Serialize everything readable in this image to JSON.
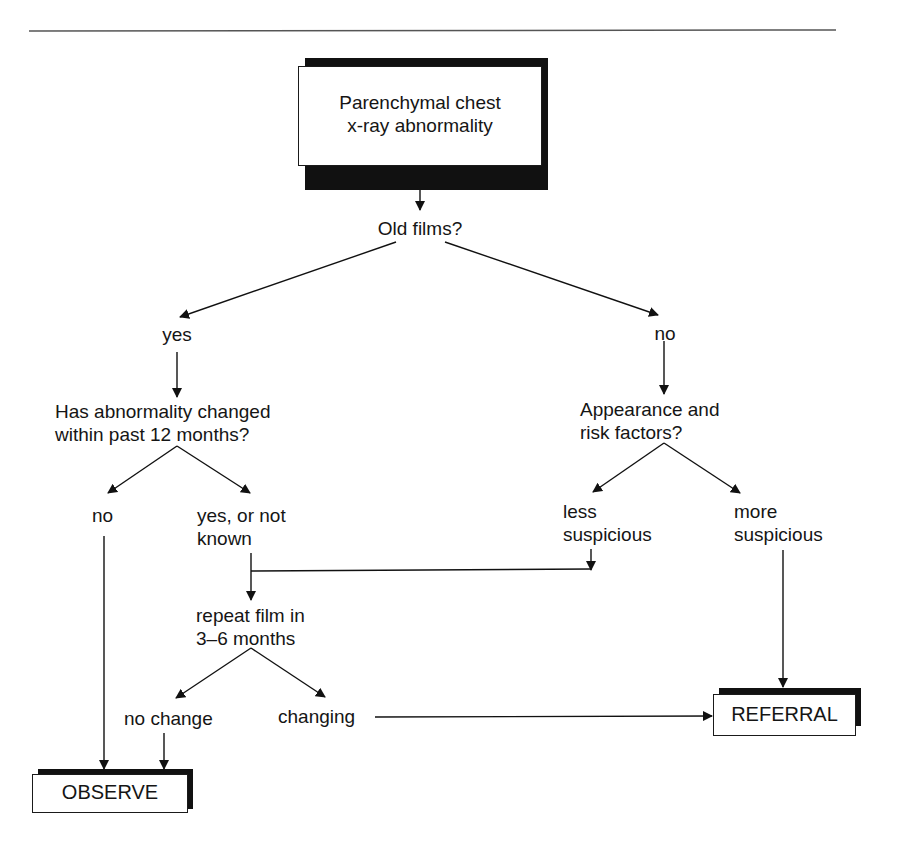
{
  "diagram": {
    "type": "flowchart",
    "nodes": {
      "start": {
        "line1": "Parenchymal chest",
        "line2": "x-ray abnormality"
      },
      "q_old_films": "Old films?",
      "old_yes": "yes",
      "old_no": "no",
      "q_changed": {
        "line1": "Has abnormality changed",
        "line2": "within past 12 months?"
      },
      "changed_no": "no",
      "changed_yes": {
        "line1": "yes, or not",
        "line2": "known"
      },
      "q_appearance": {
        "line1": "Appearance and",
        "line2": "risk factors?"
      },
      "less_suspicious": {
        "line1": "less",
        "line2": "suspicious"
      },
      "more_suspicious": {
        "line1": "more",
        "line2": "suspicious"
      },
      "repeat_film": {
        "line1": "repeat film in",
        "line2": "3–6 months"
      },
      "no_change": "no change",
      "changing": "changing",
      "observe": "OBSERVE",
      "referral": "REFERRAL"
    },
    "edges": [
      [
        "start",
        "q_old_films"
      ],
      [
        "q_old_films",
        "old_yes"
      ],
      [
        "q_old_films",
        "old_no"
      ],
      [
        "old_yes",
        "q_changed"
      ],
      [
        "old_no",
        "q_appearance"
      ],
      [
        "q_changed",
        "changed_no"
      ],
      [
        "q_changed",
        "changed_yes"
      ],
      [
        "q_appearance",
        "less_suspicious"
      ],
      [
        "q_appearance",
        "more_suspicious"
      ],
      [
        "changed_yes",
        "repeat_film"
      ],
      [
        "less_suspicious",
        "repeat_film"
      ],
      [
        "changed_no",
        "observe"
      ],
      [
        "more_suspicious",
        "referral"
      ],
      [
        "repeat_film",
        "no_change"
      ],
      [
        "repeat_film",
        "changing"
      ],
      [
        "no_change",
        "observe"
      ],
      [
        "changing",
        "referral"
      ]
    ]
  }
}
